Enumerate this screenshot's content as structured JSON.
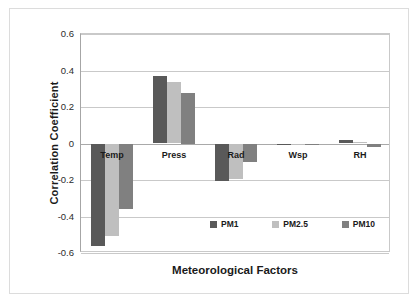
{
  "chart_data": {
    "type": "bar",
    "title": "",
    "xlabel": "Meteorological Factors",
    "ylabel": "Correlation Coefficient",
    "categories": [
      "Temp",
      "Press",
      "Rad",
      "Wsp",
      "RH"
    ],
    "series": [
      {
        "name": "PM1",
        "color": "#595959",
        "values": [
          -0.56,
          0.37,
          -0.205,
          -0.005,
          0.02
        ]
      },
      {
        "name": "PM2.5",
        "color": "#bfbfbf",
        "values": [
          -0.505,
          0.335,
          -0.195,
          -0.005,
          0.01
        ]
      },
      {
        "name": "PM10",
        "color": "#808080",
        "values": [
          -0.36,
          0.275,
          -0.1,
          -0.005,
          -0.02
        ]
      }
    ],
    "ylim": [
      -0.6,
      0.6
    ],
    "yticks": [
      0.6,
      0.4,
      0.2,
      0,
      -0.2,
      -0.4,
      -0.6
    ],
    "ytick_labels": [
      "0.6",
      "0.4",
      "0.2",
      "0",
      "-0.2",
      "-0.4",
      "-0.6"
    ],
    "grid": true,
    "legend_position": "inside-bottom-right",
    "legend_marker": "square"
  }
}
